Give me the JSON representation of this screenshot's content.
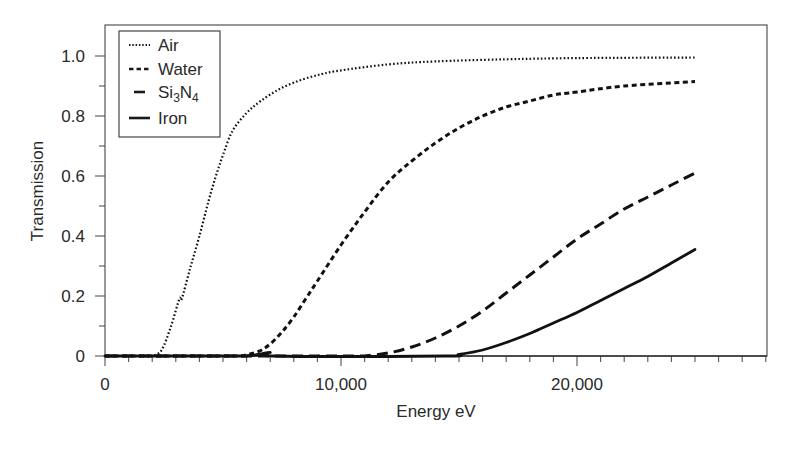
{
  "chart_data": {
    "type": "line",
    "title": "",
    "xlabel": "Energy eV",
    "ylabel": "Transmission",
    "xlim": [
      0,
      28000
    ],
    "ylim": [
      0,
      1.1
    ],
    "x_ticks": [
      0,
      10000,
      20000
    ],
    "x_tick_labels": [
      "0",
      "10,000",
      "20,000"
    ],
    "x_minor_tick_step": 1000,
    "y_ticks": [
      0,
      0.2,
      0.4,
      0.6,
      0.8,
      1.0
    ],
    "y_tick_labels": [
      "0",
      "0.2",
      "0.4",
      "0.6",
      "0.8",
      "1.0"
    ],
    "y_minor_tick_step": 0.1,
    "grid": false,
    "legend_position": "upper left",
    "series": [
      {
        "name": "Air",
        "label_main": "Air",
        "style": "dotted",
        "x": [
          2000,
          2400,
          2800,
          3150,
          3250,
          3600,
          4000,
          4400,
          4700,
          5000,
          5400,
          6000,
          6600,
          7400,
          8300,
          9200,
          10000,
          12000,
          14000,
          17000,
          20000,
          25000
        ],
        "y": [
          0,
          0.02,
          0.1,
          0.19,
          0.19,
          0.29,
          0.4,
          0.52,
          0.6,
          0.67,
          0.75,
          0.81,
          0.85,
          0.89,
          0.92,
          0.94,
          0.952,
          0.972,
          0.982,
          0.989,
          0.993,
          0.995
        ]
      },
      {
        "name": "Water",
        "label_main": "Water",
        "style": "short-dash",
        "x": [
          5800,
          6500,
          7000,
          7500,
          8000,
          8500,
          9000,
          10000,
          11000,
          12000,
          13000,
          14000,
          15000,
          16000,
          17000,
          18000,
          19000,
          20000,
          22000,
          25000
        ],
        "y": [
          0,
          0.015,
          0.04,
          0.08,
          0.13,
          0.19,
          0.25,
          0.37,
          0.48,
          0.58,
          0.65,
          0.71,
          0.76,
          0.8,
          0.83,
          0.85,
          0.87,
          0.88,
          0.9,
          0.915
        ]
      },
      {
        "name": "Si3N4",
        "label_main": "Si",
        "label_sub1": "3",
        "label_mid": "N",
        "label_sub2": "4",
        "style": "long-dash",
        "x": [
          11000,
          12000,
          13000,
          14000,
          15000,
          16000,
          17000,
          18000,
          19000,
          20000,
          21000,
          22000,
          23000,
          24000,
          25000
        ],
        "y": [
          0,
          0.01,
          0.03,
          0.06,
          0.1,
          0.15,
          0.21,
          0.27,
          0.33,
          0.39,
          0.44,
          0.49,
          0.53,
          0.57,
          0.61
        ]
      },
      {
        "name": "Iron",
        "label_main": "Iron",
        "style": "solid",
        "x": [
          6000,
          6500,
          7000,
          7100,
          14400,
          15000,
          16000,
          17000,
          18000,
          19000,
          20000,
          21000,
          22000,
          23000,
          24000,
          25000
        ],
        "y": [
          0,
          0.005,
          0.012,
          0,
          0,
          0.005,
          0.02,
          0.045,
          0.075,
          0.11,
          0.145,
          0.185,
          0.225,
          0.265,
          0.31,
          0.355
        ]
      }
    ]
  }
}
